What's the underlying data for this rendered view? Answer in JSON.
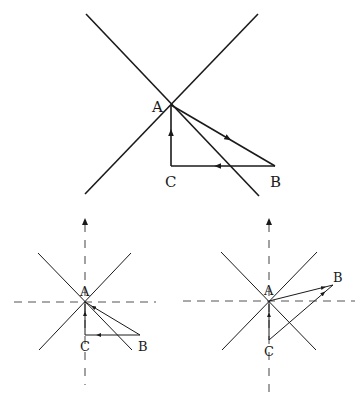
{
  "colors": {
    "background": "#ffffff",
    "line": "#1a1a1a",
    "dashed": "#555555"
  },
  "diagrams": [
    {
      "id": "top",
      "cross_lines": [
        {
          "x1": 86,
          "y1": 14,
          "x2": 259,
          "y2": 196
        },
        {
          "x1": 258,
          "y1": 14,
          "x2": 85,
          "y2": 194
        }
      ],
      "points": {
        "A": {
          "x": 171,
          "y": 105,
          "label": "A",
          "lx": 152,
          "ly": 112
        },
        "B": {
          "x": 275,
          "y": 166,
          "label": "B",
          "lx": 270,
          "ly": 187
        },
        "C": {
          "x": 171,
          "y": 166,
          "label": "C",
          "lx": 165,
          "ly": 187
        }
      },
      "segments": [
        {
          "from": "A",
          "to": "B",
          "arrow_at": 0.55,
          "direction": "A-to-B"
        },
        {
          "from": "B",
          "to": "C",
          "arrow_at": 0.55,
          "direction": "B-to-C"
        },
        {
          "from": "C",
          "to": "A",
          "arrow_at": 0.55,
          "direction": "C-to-A"
        }
      ]
    },
    {
      "id": "bottom-left",
      "axis_vertical": {
        "x": 85,
        "y_top": 218,
        "y_bottom": 385,
        "arrow": "up"
      },
      "axis_horizontal": {
        "y": 302,
        "x_left": 14,
        "x_right": 156
      },
      "cross_lines": [
        {
          "x1": 38,
          "y1": 253,
          "x2": 132,
          "y2": 350
        },
        {
          "x1": 131,
          "y1": 253,
          "x2": 39,
          "y2": 350
        }
      ],
      "points": {
        "A": {
          "x": 85,
          "y": 302,
          "label": "A",
          "lx": 80,
          "ly": 296
        },
        "B": {
          "x": 140,
          "y": 335,
          "label": "B",
          "lx": 138,
          "ly": 351
        },
        "C": {
          "x": 85,
          "y": 335,
          "label": "C",
          "lx": 80,
          "ly": 351
        }
      },
      "segments": [
        {
          "from": "B",
          "to": "A",
          "arrow_at": 0.85,
          "direction": "B-to-A"
        },
        {
          "from": "B",
          "to": "C",
          "arrow_at": 0.75,
          "direction": "B-to-C"
        },
        {
          "from": "C",
          "to": "A",
          "arrow_at": 0.65,
          "direction": "C-to-A"
        }
      ]
    },
    {
      "id": "bottom-right",
      "axis_vertical": {
        "x": 269,
        "y_top": 218,
        "y_bottom": 398,
        "arrow": "up"
      },
      "axis_horizontal": {
        "y": 301,
        "x_left": 183,
        "x_right": 355
      },
      "cross_lines": [
        {
          "x1": 221,
          "y1": 252,
          "x2": 316,
          "y2": 350
        },
        {
          "x1": 317,
          "y1": 252,
          "x2": 222,
          "y2": 350
        }
      ],
      "points": {
        "A": {
          "x": 269,
          "y": 301,
          "label": "A",
          "lx": 264,
          "ly": 295
        },
        "B": {
          "x": 333,
          "y": 285,
          "label": "B",
          "lx": 333,
          "ly": 282
        },
        "C": {
          "x": 269,
          "y": 340,
          "label": "C",
          "lx": 264,
          "ly": 356
        }
      },
      "segments": [
        {
          "from": "A",
          "to": "B",
          "arrow_at": 0.85,
          "direction": "A-to-B"
        },
        {
          "from": "C",
          "to": "B",
          "arrow_at": 0.85,
          "direction": "C-to-B"
        },
        {
          "from": "C",
          "to": "A",
          "arrow_at": 0.65,
          "direction": "C-to-A"
        }
      ]
    }
  ]
}
